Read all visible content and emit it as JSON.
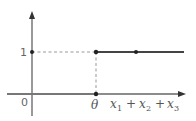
{
  "diagram": {
    "type": "step-function-graph",
    "axes": {
      "origin_label": "0",
      "x_axis_label": {
        "var": "x",
        "terms": [
          {
            "base": "x",
            "sub": "1"
          },
          {
            "base": "x",
            "sub": "2"
          },
          {
            "base": "x",
            "sub": "3"
          }
        ],
        "operator": "+"
      },
      "y_tick_label": "1",
      "x_tick_label": "θ"
    },
    "colors": {
      "axis": "#666666",
      "step_line": "#444444",
      "dashed_guide": "#999999",
      "dot": "#222222",
      "text": "#555555"
    },
    "step": {
      "threshold": "θ",
      "low_value": "0",
      "high_value": "1"
    }
  }
}
